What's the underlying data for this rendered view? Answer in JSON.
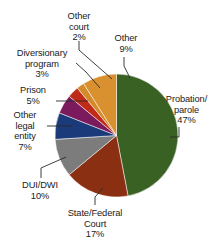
{
  "chart_data": {
    "type": "pie",
    "title": "",
    "subtitle": "",
    "xlabel": "",
    "ylabel": "",
    "legend_position": "none",
    "grid": false,
    "units": "percent",
    "start_angle_deg": 0,
    "direction": "clockwise",
    "categories": [
      "Probation/ parole",
      "State/Federal Court",
      "DUI/DWI",
      "Other legal entity",
      "Prison",
      "Diversionary program",
      "Other court",
      "Other"
    ],
    "values": [
      47,
      17,
      10,
      7,
      5,
      3,
      2,
      9
    ],
    "colors": [
      "#3a6124",
      "#8a2f12",
      "#7c7c7c",
      "#1b3a7a",
      "#7b1a5c",
      "#c02a18",
      "#d58a2a",
      "#d9912f"
    ],
    "slices": [
      {
        "label": "Probation/ parole",
        "value": 47,
        "value_text": "47%",
        "color": "#3a6124"
      },
      {
        "label": "State/Federal Court",
        "value": 17,
        "value_text": "17%",
        "color": "#8a2f12"
      },
      {
        "label": "DUI/DWI",
        "value": 10,
        "value_text": "10%",
        "color": "#7c7c7c"
      },
      {
        "label": "Other legal entity",
        "value": 7,
        "value_text": "7%",
        "color": "#1b3a7a"
      },
      {
        "label": "Prison",
        "value": 5,
        "value_text": "5%",
        "color": "#7b1a5c"
      },
      {
        "label": "Diversionary program",
        "value": 3,
        "value_text": "3%",
        "color": "#c02a18"
      },
      {
        "label": "Other court",
        "value": 2,
        "value_text": "2%",
        "color": "#d58a2a"
      },
      {
        "label": "Other",
        "value": 9,
        "value_text": "9%",
        "color": "#d9912f"
      }
    ]
  },
  "labels": {
    "other_court": {
      "line1": "Other",
      "line2": "court",
      "line3": "2%"
    },
    "other": {
      "line1": "Other",
      "line2": "9%",
      "line3": ""
    },
    "diversionary": {
      "line1": "Diversionary",
      "line2": "program",
      "line3": "3%"
    },
    "prison": {
      "line1": "Prison",
      "line2": "5%",
      "line3": ""
    },
    "other_legal": {
      "line1": "Other",
      "line2": "legal",
      "line3": "entity",
      "line4": "7%"
    },
    "dui": {
      "line1": "DUI/DWI",
      "line2": "10%",
      "line3": ""
    },
    "state_fed": {
      "line1": "State/Federal",
      "line2": "Court",
      "line3": "17%"
    },
    "probation": {
      "line1": "Probation/",
      "line2": "parole",
      "line3": "47%"
    }
  },
  "leader_color": "#2a2a2a",
  "background_color": "#ffffff"
}
